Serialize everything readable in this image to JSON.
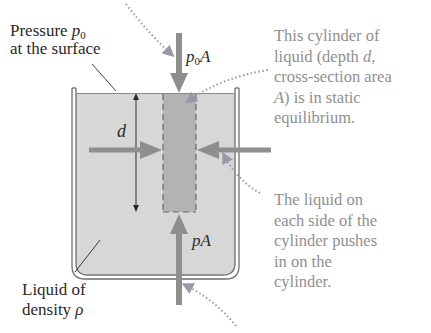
{
  "diagram": {
    "colors": {
      "liquid": "#d7d7d7",
      "cylinder": "#b3b3b3",
      "arrow": "#8e8e8e",
      "tank_outline": "#6e6e6e",
      "dotted_leader": "#9a9aa6",
      "dark_text": "#2a2a2a",
      "callout_text": "#8f8f8f"
    },
    "labels": {
      "surface_pressure": {
        "line1_prefix": "Pressure ",
        "symbol": "p",
        "subscript": "0",
        "line2": "at the surface"
      },
      "top_force": {
        "symbol": "p",
        "subscript": "0",
        "suffix": "A"
      },
      "bottom_force": {
        "text": "pA"
      },
      "depth": {
        "text": "d"
      },
      "liquid_density": {
        "line1": "Liquid of",
        "line2_prefix": "density ",
        "symbol": "ρ"
      }
    },
    "callouts": {
      "cylinder_equilibrium": {
        "lines": [
          "This cylinder of",
          "liquid (depth ",
          "d",
          ",",
          "cross-section area",
          "A",
          ") is in static",
          "equilibrium."
        ]
      },
      "side_pressure": {
        "lines": [
          "The liquid on",
          "each side of the",
          "cylinder pushes",
          "in on the",
          "cylinder."
        ]
      }
    },
    "icons": {
      "top_force_arrow": "down-arrow",
      "bottom_force_arrow": "up-arrow",
      "left_side_arrow": "right-arrow",
      "right_side_arrow": "left-arrow",
      "depth_arrow": "double-headed-vertical-arrow"
    }
  }
}
